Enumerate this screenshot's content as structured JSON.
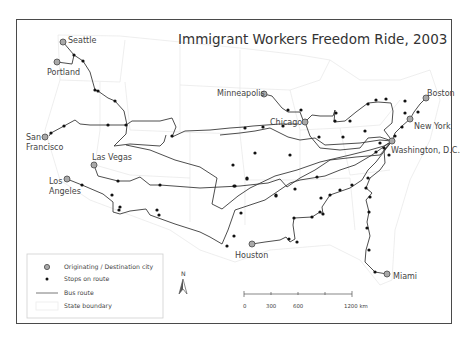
{
  "title": "Immigrant Workers Freedom Ride, 2003",
  "cities": [
    {
      "name": "Seattle",
      "x": 63,
      "y": 42,
      "lx": 68,
      "ly": 42,
      "anchor": "start"
    },
    {
      "name": "Portland",
      "x": 57,
      "y": 62,
      "lx": 47,
      "ly": 74,
      "anchor": "start"
    },
    {
      "name": "San",
      "x": 49,
      "y": 136,
      "lx": 26,
      "ly": 139,
      "anchor": "start"
    },
    {
      "name": "Francisco",
      "x": -1,
      "y": -1,
      "lx": 26,
      "ly": 149,
      "anchor": "start"
    },
    {
      "name": "Las Vegas",
      "x": 94,
      "y": 165,
      "lx": 92,
      "ly": 160,
      "anchor": "start"
    },
    {
      "name": "Los",
      "x": 67,
      "y": 179,
      "lx": 49,
      "ly": 183,
      "anchor": "start"
    },
    {
      "name": "Angeles",
      "x": -1,
      "y": -1,
      "lx": 49,
      "ly": 194,
      "anchor": "start"
    },
    {
      "name": "Minneapolis",
      "x": 264,
      "y": 94,
      "lx": 217,
      "ly": 95,
      "anchor": "start"
    },
    {
      "name": "Chicago",
      "x": 305,
      "y": 122,
      "lx": 269,
      "ly": 124,
      "anchor": "start"
    },
    {
      "name": "Boston",
      "x": 426,
      "y": 98,
      "lx": 427,
      "ly": 96,
      "anchor": "start"
    },
    {
      "name": "New York",
      "x": 410,
      "y": 119,
      "lx": 414,
      "ly": 129,
      "anchor": "start"
    },
    {
      "name": "Washington, D.C.",
      "x": 392,
      "y": 141,
      "lx": 391,
      "ly": 152,
      "anchor": "start"
    },
    {
      "name": "Houston",
      "x": 252,
      "y": 244,
      "lx": 235,
      "ly": 257,
      "anchor": "start"
    },
    {
      "name": "Miami",
      "x": 387,
      "y": 274,
      "lx": 393,
      "ly": 278,
      "anchor": "start"
    }
  ],
  "legend": {
    "items": [
      {
        "symbol": "city",
        "label": "Originating / Destination city"
      },
      {
        "symbol": "stop",
        "label": "Stops on route"
      },
      {
        "symbol": "route",
        "label": "Bus route"
      },
      {
        "symbol": "state",
        "label": "State boundary"
      }
    ]
  },
  "north_arrow": {
    "label": "N"
  },
  "scale_bar": {
    "ticks": [
      "0",
      "300",
      "600",
      "1200 km"
    ],
    "unit": "km"
  },
  "colors": {
    "route": "#3a3a3a",
    "stop": "#111111",
    "city_fill": "#a9a9a9",
    "state_boundary": "#e6e6e6",
    "frame": "#4a4a4a"
  }
}
